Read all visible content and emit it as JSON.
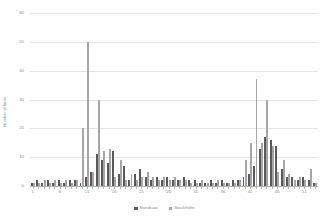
{
  "chart_data": {
    "type": "bar",
    "title": "",
    "subtitle": "",
    "xlabel": "",
    "ylabel": "Number of birds",
    "ylim": [
      0,
      60
    ],
    "ytick_values": [
      0,
      10,
      20,
      30,
      40,
      50,
      60
    ],
    "ytick_labels": [
      "0",
      "10",
      "20",
      "30",
      "40",
      "50",
      "60"
    ],
    "grid": true,
    "legend_position": "bottom",
    "xlim": [
      0.5,
      53.5
    ],
    "xtick_values": [
      1,
      6,
      11,
      16,
      21,
      26,
      31,
      36,
      41,
      46,
      51
    ],
    "xtick_labels": [
      "1",
      "6",
      "11",
      "16",
      "21",
      "26",
      "31",
      "36",
      "41",
      "46",
      "51"
    ],
    "categories": [
      1,
      2,
      3,
      4,
      5,
      6,
      7,
      8,
      9,
      10,
      11,
      12,
      13,
      14,
      15,
      16,
      17,
      18,
      19,
      20,
      21,
      22,
      23,
      24,
      25,
      26,
      27,
      28,
      29,
      30,
      31,
      32,
      33,
      34,
      35,
      36,
      37,
      38,
      39,
      40,
      41,
      42,
      43,
      44,
      45,
      46,
      47,
      48,
      49,
      50,
      51,
      52,
      53
    ],
    "series": [
      {
        "name": "Bandsaw",
        "color": "#595959",
        "values": [
          1,
          2,
          1,
          2,
          1,
          2,
          1,
          2,
          2,
          1,
          3,
          5,
          11,
          9,
          8,
          12,
          4,
          7,
          2,
          4,
          6,
          3,
          2,
          3,
          2,
          3,
          2,
          2,
          3,
          2,
          2,
          1,
          1,
          2,
          1,
          2,
          1,
          2,
          2,
          3,
          4,
          7,
          13,
          17,
          16,
          14,
          6,
          3,
          3,
          2,
          3,
          2,
          1
        ]
      },
      {
        "name": "Stockholm",
        "color": "#a6a6a6",
        "values": [
          1,
          1,
          2,
          1,
          2,
          1,
          2,
          1,
          2,
          20,
          50,
          5,
          30,
          12,
          13,
          3,
          9,
          2,
          4,
          2,
          3,
          5,
          3,
          2,
          3,
          2,
          3,
          2,
          2,
          1,
          1,
          2,
          1,
          1,
          2,
          1,
          1,
          1,
          2,
          9,
          15,
          37,
          15,
          30,
          14,
          5,
          9,
          4,
          2,
          3,
          2,
          6,
          1
        ]
      }
    ]
  },
  "legend": {
    "items": [
      {
        "label": "Bandsaw",
        "color": "#595959"
      },
      {
        "label": "Stockholm",
        "color": "#a6a6a6"
      }
    ]
  }
}
